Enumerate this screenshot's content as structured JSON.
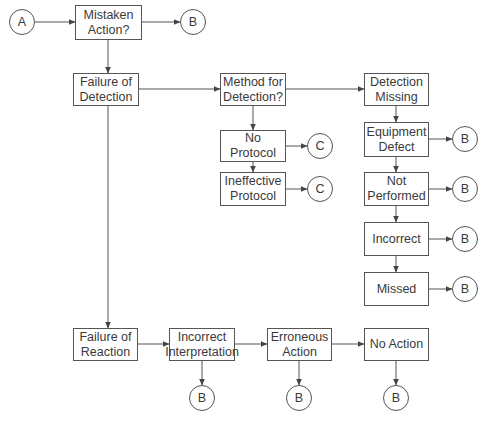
{
  "diagram": {
    "type": "flowchart",
    "colors": {
      "stroke": "#555555",
      "text": "#3a3a3a",
      "background": "#ffffff"
    },
    "connectors": {
      "A": "A",
      "B": "B",
      "C": "C"
    },
    "nodes": {
      "mistaken_action": "Mistaken\nAction?",
      "failure_detection": "Failure of\nDetection",
      "method_detection": "Method for\nDetection?",
      "detection_missing": "Detection\nMissing",
      "no_protocol": "No Protocol",
      "ineffective_protocol": "Ineffective\nProtocol",
      "equipment_defect": "Equipment\nDefect",
      "not_performed": "Not\nPerformed",
      "incorrect": "Incorrect",
      "missed": "Missed",
      "failure_reaction": "Failure of\nReaction",
      "incorrect_interpretation": "Incorrect\nInterpretation",
      "erroneous_action": "Erroneous\nAction",
      "no_action": "No Action"
    },
    "edges": [
      [
        "A",
        "Mistaken Action?"
      ],
      [
        "Mistaken Action?",
        "B"
      ],
      [
        "Mistaken Action?",
        "Failure of Detection"
      ],
      [
        "Failure of Detection",
        "Method for Detection?"
      ],
      [
        "Method for Detection?",
        "Detection Missing"
      ],
      [
        "Method for Detection?",
        "No Protocol"
      ],
      [
        "No Protocol",
        "C"
      ],
      [
        "No Protocol",
        "Ineffective Protocol"
      ],
      [
        "Ineffective Protocol",
        "C"
      ],
      [
        "Detection Missing",
        "Equipment Defect"
      ],
      [
        "Equipment Defect",
        "B"
      ],
      [
        "Equipment Defect",
        "Not Performed"
      ],
      [
        "Not Performed",
        "B"
      ],
      [
        "Not Performed",
        "Incorrect"
      ],
      [
        "Incorrect",
        "B"
      ],
      [
        "Incorrect",
        "Missed"
      ],
      [
        "Missed",
        "B"
      ],
      [
        "Failure of Detection",
        "Failure of Reaction"
      ],
      [
        "Failure of Reaction",
        "Incorrect Interpretation"
      ],
      [
        "Incorrect Interpretation",
        "B"
      ],
      [
        "Incorrect Interpretation",
        "Erroneous Action"
      ],
      [
        "Erroneous Action",
        "B"
      ],
      [
        "Erroneous Action",
        "No Action"
      ],
      [
        "No Action",
        "B"
      ]
    ]
  }
}
